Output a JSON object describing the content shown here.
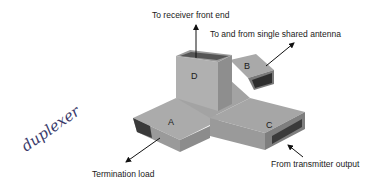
{
  "diagram": {
    "annotation": "duplexer",
    "ports": {
      "A": "A",
      "B": "B",
      "C": "C",
      "D": "D"
    },
    "labels": {
      "receiver": "To receiver front end",
      "antenna": "To and from single shared antenna",
      "termination": "Termination load",
      "transmitter": "From transmitter output"
    },
    "colors": {
      "top": "#a9a9a9",
      "side_light": "#b8b8b8",
      "side_dark": "#8a8a8a",
      "opening": "#3a3a3a",
      "text": "#1a1a1a"
    }
  }
}
